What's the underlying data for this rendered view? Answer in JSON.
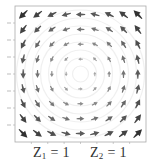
{
  "chart_data": {
    "type": "quiver",
    "title": "",
    "xlabel": "",
    "ylabel": "",
    "xlim": [
      -2.0,
      2.0
    ],
    "ylim": [
      -2.0,
      2.0
    ],
    "xticks": [
      -1.5,
      -1.0,
      -0.5,
      0.0,
      0.5,
      1.0,
      1.5
    ],
    "yticks": [
      -1.5,
      -1.0,
      -0.5,
      0.0,
      0.5,
      1.0,
      1.5
    ],
    "tick_labels_legible": false,
    "grid": false,
    "legend": null,
    "field": {
      "description": "counter-clockwise rotational vector field centered at origin; magnitude grows with distance from center",
      "formula": {
        "u": "-y",
        "v": "x"
      },
      "grid_points_x": [
        -1.75,
        -1.3125,
        -0.875,
        -0.4375,
        0.0,
        0.4375,
        0.875,
        1.3125,
        1.75
      ],
      "grid_points_y": [
        -1.75,
        -1.3125,
        -0.875,
        -0.4375,
        0.0,
        0.4375,
        0.875,
        1.3125,
        1.75
      ],
      "arrow_color": "#555555",
      "background_swirl_color": "#f0f0f0"
    }
  },
  "captions": {
    "z1": {
      "var": "Z",
      "sub": "1",
      "rest": " = 1"
    },
    "z2": {
      "var": "Z",
      "sub": "2",
      "rest": " = 1"
    }
  },
  "colors": {
    "axis": "#aaaaaa",
    "arrow_dark": "#333333",
    "arrow_light": "#bbbbbb"
  }
}
